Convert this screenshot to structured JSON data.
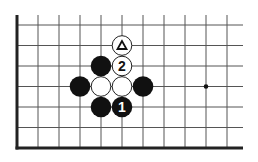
{
  "diagram": {
    "type": "go-board-fragment",
    "grid": {
      "cols": 11,
      "rows": 7,
      "origin_x": 17,
      "origin_y": 25,
      "spacing_x": 21,
      "spacing_y": 20.5,
      "right_extent": 243,
      "thick_edges": [
        "left",
        "bottom"
      ],
      "line_color": "#555555",
      "edge_color": "#222222"
    },
    "star_points": [
      {
        "col": 9,
        "row": 3
      }
    ],
    "stones": [
      {
        "color": "white",
        "col": 5,
        "row": 1,
        "mark": "triangle",
        "label": "△"
      },
      {
        "color": "white",
        "col": 5,
        "row": 2,
        "mark": "number",
        "label": "2"
      },
      {
        "color": "black",
        "col": 4,
        "row": 2,
        "mark": "",
        "label": ""
      },
      {
        "color": "black",
        "col": 3,
        "row": 3,
        "mark": "",
        "label": ""
      },
      {
        "color": "white",
        "col": 4,
        "row": 3,
        "mark": "",
        "label": ""
      },
      {
        "color": "white",
        "col": 5,
        "row": 3,
        "mark": "",
        "label": ""
      },
      {
        "color": "black",
        "col": 6,
        "row": 3,
        "mark": "",
        "label": ""
      },
      {
        "color": "black",
        "col": 4,
        "row": 4,
        "mark": "",
        "label": ""
      },
      {
        "color": "black",
        "col": 5,
        "row": 4,
        "mark": "number",
        "label": "1"
      }
    ],
    "colors": {
      "black_stone": "#111111",
      "white_stone": "#ffffff",
      "white_stone_border": "#222222",
      "label_on_black": "#ffffff",
      "label_on_white": "#111111"
    }
  }
}
